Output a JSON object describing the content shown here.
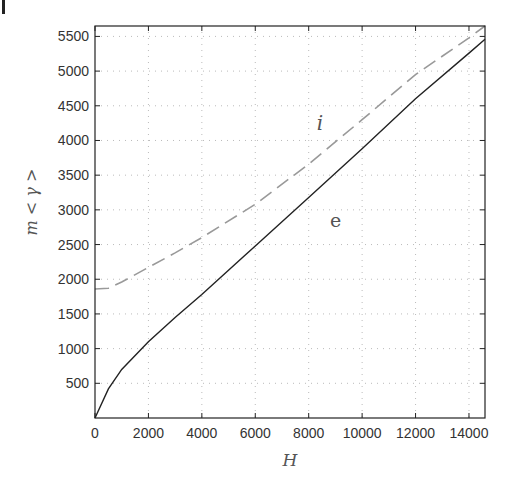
{
  "chart_data": {
    "type": "line",
    "title": "",
    "xlabel": "H",
    "ylabel": "m < γ >",
    "xlim": [
      0,
      14600
    ],
    "ylim": [
      0,
      5650
    ],
    "xticks": [
      0,
      2000,
      4000,
      6000,
      8000,
      10000,
      12000,
      14000
    ],
    "yticks": [
      500,
      1000,
      1500,
      2000,
      2500,
      3000,
      3500,
      4000,
      4500,
      5000,
      5500
    ],
    "grid": true,
    "legend": null,
    "annotations": [
      {
        "text": "i",
        "x": 8300,
        "y": 4150
      },
      {
        "text": "e",
        "x": 8800,
        "y": 2750
      }
    ],
    "series": [
      {
        "name": "e",
        "style": "solid",
        "color": "#222222",
        "x": [
          0,
          500,
          1000,
          2000,
          3000,
          4000,
          6000,
          8000,
          10000,
          12000,
          14000,
          14600
        ],
        "y": [
          0,
          420,
          700,
          1100,
          1450,
          1780,
          2480,
          3180,
          3880,
          4600,
          5260,
          5460
        ]
      },
      {
        "name": "i",
        "style": "dashed",
        "color": "#999999",
        "x": [
          0,
          500,
          1000,
          2000,
          3000,
          4000,
          6000,
          8000,
          10000,
          12000,
          14000,
          14600
        ],
        "y": [
          1860,
          1870,
          1960,
          2170,
          2380,
          2600,
          3080,
          3660,
          4300,
          4950,
          5480,
          5650
        ]
      }
    ]
  },
  "labels": {
    "xlabel": "H",
    "ylabel": "m < γ >",
    "curve_i": "i",
    "curve_e": "e"
  }
}
